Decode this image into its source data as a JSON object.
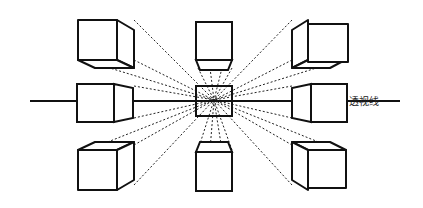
{
  "diagram": {
    "title": "",
    "labels": {
      "sight_line": "透视线"
    },
    "elements": [
      "center-cube",
      "top-left-cube",
      "top-center-cube",
      "top-right-cube",
      "middle-left-cube",
      "middle-right-cube",
      "bottom-left-cube",
      "bottom-center-cube",
      "bottom-right-cube",
      "horizon-line",
      "perspective-lines"
    ],
    "colors": {
      "line": "#111111",
      "background": "#ffffff"
    }
  }
}
